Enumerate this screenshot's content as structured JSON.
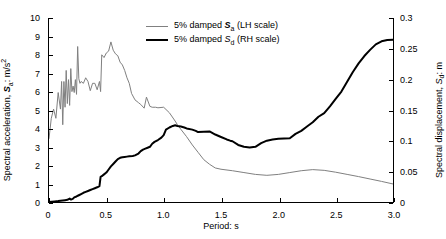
{
  "figure": {
    "width": 446,
    "height": 239,
    "background": "#ffffff"
  },
  "axes": {
    "x": {
      "label": "Period: s",
      "min": 0,
      "max": 3.0,
      "ticks": [
        0,
        0.5,
        1.0,
        1.5,
        2.0,
        2.5,
        3.0
      ],
      "tick_labels": [
        "0",
        "0.5",
        "1.0",
        "1.5",
        "2.0",
        "2.5",
        "3.0"
      ]
    },
    "y_left": {
      "label_prefix": "Spectral acceleration, ",
      "label_symbol": "S",
      "label_sub": "a",
      "label_suffix": ": m/s",
      "label_sup": "2",
      "min": 0,
      "max": 10,
      "ticks": [
        0,
        1,
        2,
        3,
        4,
        5,
        6,
        7,
        8,
        9,
        10
      ],
      "tick_labels": [
        "0",
        "1",
        "2",
        "3",
        "4",
        "5",
        "6",
        "7",
        "8",
        "9",
        "10"
      ]
    },
    "y_right": {
      "label_prefix": "Spectral displacement, ",
      "label_symbol": "S",
      "label_sub": "d",
      "label_suffix": ": m",
      "min": 0,
      "max": 0.3,
      "ticks": [
        0,
        0.05,
        0.1,
        0.15,
        0.2,
        0.25,
        0.3
      ],
      "tick_labels": [
        "0",
        "0.05",
        "0.1",
        "0.15",
        "0.2",
        "0.25",
        "0.3"
      ]
    }
  },
  "legend": {
    "position": "top-center",
    "items": [
      {
        "prefix": "5% damped ",
        "symbol": "S",
        "sub": "a",
        "suffix": " (LH scale)",
        "color": "#808080",
        "width": 1,
        "style": "thin-gray"
      },
      {
        "prefix": "5% damped ",
        "symbol": "S",
        "sub": "d",
        "suffix": " (RH scale)",
        "color": "#000000",
        "width": 2,
        "style": "thick-black"
      }
    ]
  },
  "chart_data": {
    "type": "line",
    "title": "",
    "xlabel": "Period: s",
    "ylabel": "Spectral acceleration, Sa: m/s^2",
    "ylabel_right": "Spectral displacement, Sd: m",
    "xlim": [
      0,
      3.0
    ],
    "ylim": [
      0,
      10
    ],
    "ylim_right": [
      0,
      0.3
    ],
    "grid": false,
    "legend_position": "top-center",
    "series": [
      {
        "name": "5% damped Sa (LH scale)",
        "axis": "left",
        "units": "m/s^2",
        "color": "#808080",
        "line_width": 1,
        "x": [
          0.0,
          0.02,
          0.04,
          0.06,
          0.08,
          0.1,
          0.11,
          0.12,
          0.13,
          0.14,
          0.15,
          0.16,
          0.17,
          0.18,
          0.19,
          0.2,
          0.21,
          0.22,
          0.23,
          0.24,
          0.25,
          0.26,
          0.27,
          0.28,
          0.3,
          0.32,
          0.34,
          0.36,
          0.38,
          0.4,
          0.42,
          0.44,
          0.45,
          0.46,
          0.48,
          0.5,
          0.52,
          0.54,
          0.56,
          0.58,
          0.6,
          0.62,
          0.64,
          0.66,
          0.68,
          0.7,
          0.72,
          0.75,
          0.78,
          0.8,
          0.83,
          0.85,
          0.88,
          0.9,
          0.93,
          0.95,
          1.0,
          1.05,
          1.1,
          1.12,
          1.15,
          1.2,
          1.25,
          1.3,
          1.35,
          1.4,
          1.45,
          1.5,
          1.6,
          1.7,
          1.8,
          1.9,
          2.0,
          2.1,
          2.2,
          2.3,
          2.4,
          2.5,
          2.6,
          2.7,
          2.8,
          2.9,
          3.0
        ],
        "y": [
          3.45,
          4.55,
          5.05,
          4.55,
          5.95,
          5.05,
          6.55,
          4.2,
          6.55,
          5.15,
          7.15,
          5.35,
          6.65,
          5.25,
          7.25,
          6.0,
          6.3,
          5.95,
          6.65,
          5.85,
          8.45,
          6.7,
          6.45,
          6.55,
          6.45,
          6.75,
          6.55,
          6.05,
          6.45,
          6.45,
          6.1,
          6.55,
          6.0,
          8.0,
          7.85,
          8.1,
          8.2,
          8.7,
          8.25,
          8.05,
          7.95,
          7.6,
          7.45,
          7.15,
          6.75,
          6.45,
          5.9,
          5.55,
          5.4,
          5.3,
          5.1,
          5.7,
          5.2,
          5.15,
          5.15,
          5.12,
          5.15,
          4.85,
          4.4,
          4.2,
          3.95,
          3.55,
          3.1,
          2.7,
          2.3,
          2.05,
          1.85,
          1.78,
          1.7,
          1.6,
          1.5,
          1.45,
          1.5,
          1.6,
          1.7,
          1.76,
          1.72,
          1.62,
          1.5,
          1.38,
          1.25,
          1.12,
          0.98
        ]
      },
      {
        "name": "5% damped Sd (RH scale)",
        "axis": "right",
        "units": "m",
        "color": "#000000",
        "line_width": 2,
        "x": [
          0.0,
          0.05,
          0.08,
          0.1,
          0.12,
          0.14,
          0.16,
          0.18,
          0.19,
          0.2,
          0.21,
          0.22,
          0.24,
          0.26,
          0.28,
          0.3,
          0.32,
          0.34,
          0.36,
          0.38,
          0.4,
          0.42,
          0.44,
          0.45,
          0.46,
          0.48,
          0.5,
          0.52,
          0.54,
          0.56,
          0.58,
          0.6,
          0.62,
          0.64,
          0.66,
          0.68,
          0.7,
          0.73,
          0.75,
          0.78,
          0.8,
          0.82,
          0.84,
          0.86,
          0.88,
          0.9,
          0.92,
          0.95,
          0.98,
          1.0,
          1.02,
          1.05,
          1.08,
          1.1,
          1.12,
          1.15,
          1.18,
          1.2,
          1.25,
          1.28,
          1.3,
          1.35,
          1.4,
          1.45,
          1.5,
          1.55,
          1.58,
          1.6,
          1.65,
          1.7,
          1.75,
          1.8,
          1.85,
          1.9,
          1.95,
          2.0,
          2.05,
          2.1,
          2.15,
          2.2,
          2.25,
          2.3,
          2.35,
          2.4,
          2.45,
          2.5,
          2.55,
          2.6,
          2.65,
          2.7,
          2.75,
          2.8,
          2.85,
          2.9,
          2.95,
          3.0
        ],
        "y": [
          0.0,
          0.001,
          0.0015,
          0.002,
          0.0025,
          0.003,
          0.0035,
          0.0055,
          0.004,
          0.0045,
          0.0055,
          0.0075,
          0.009,
          0.011,
          0.013,
          0.015,
          0.0165,
          0.018,
          0.0195,
          0.021,
          0.0225,
          0.024,
          0.026,
          0.041,
          0.042,
          0.045,
          0.048,
          0.053,
          0.058,
          0.062,
          0.066,
          0.07,
          0.072,
          0.073,
          0.0735,
          0.074,
          0.0745,
          0.075,
          0.076,
          0.079,
          0.083,
          0.0855,
          0.087,
          0.0885,
          0.09,
          0.095,
          0.098,
          0.101,
          0.105,
          0.109,
          0.118,
          0.1215,
          0.124,
          0.125,
          0.124,
          0.123,
          0.1215,
          0.12,
          0.118,
          0.116,
          0.114,
          0.1145,
          0.115,
          0.11,
          0.106,
          0.102,
          0.1,
          0.099,
          0.093,
          0.09,
          0.089,
          0.09,
          0.096,
          0.1,
          0.102,
          0.103,
          0.1035,
          0.104,
          0.111,
          0.116,
          0.123,
          0.13,
          0.139,
          0.145,
          0.156,
          0.168,
          0.18,
          0.196,
          0.212,
          0.226,
          0.238,
          0.248,
          0.257,
          0.262,
          0.264,
          0.2645
        ]
      }
    ]
  }
}
